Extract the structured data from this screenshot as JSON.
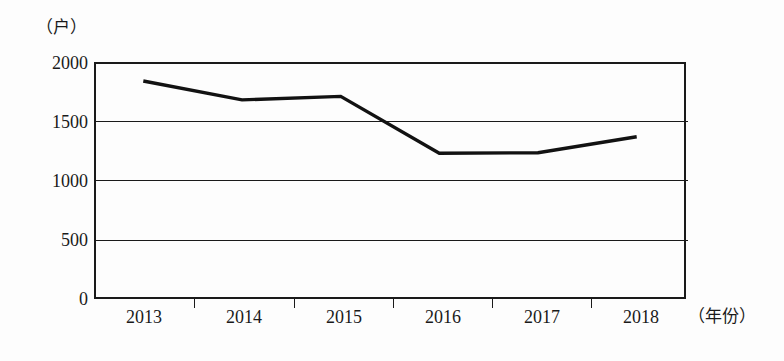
{
  "chart_data": {
    "type": "line",
    "title": "",
    "subtitle": "",
    "xlabel": "（年份）",
    "ylabel": "（户）",
    "categories": [
      "2013",
      "2014",
      "2015",
      "2016",
      "2017",
      "2018"
    ],
    "values": [
      1840,
      1680,
      1710,
      1230,
      1235,
      1370
    ],
    "series": [
      {
        "name": "",
        "values": [
          1840,
          1680,
          1710,
          1230,
          1235,
          1370
        ]
      }
    ],
    "ylim": [
      0,
      2000
    ],
    "y_ticks": [
      "0",
      "500",
      "1000",
      "1500",
      "2000"
    ],
    "y_tick_values": [
      0,
      500,
      1000,
      1500,
      2000
    ],
    "x_tick_labels": [
      "2013",
      "2014",
      "2015",
      "2016",
      "2017",
      "2018"
    ],
    "grid": "horizontal",
    "legend": "none",
    "line_color": "#121212",
    "axis_color": "#1a1a1a",
    "background_color": "#fdfdfd"
  },
  "axes": {
    "y_unit": "（户）",
    "x_unit": "（年份）"
  }
}
